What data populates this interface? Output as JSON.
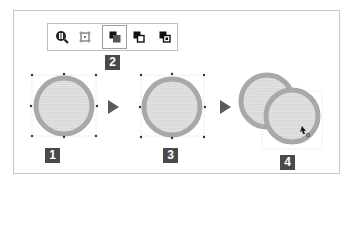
{
  "diagram": {
    "toolbar": {
      "buttons": [
        {
          "name": "zoom-object",
          "icon": "magnifier-icon",
          "active": false
        },
        {
          "name": "fit-object",
          "icon": "frame-center-icon",
          "active": false
        },
        {
          "name": "bring-to-front",
          "icon": "bring-front-icon",
          "active": true
        },
        {
          "name": "bring-forward",
          "icon": "bring-forward-icon",
          "active": false
        },
        {
          "name": "send-backward",
          "icon": "send-backward-icon",
          "active": false
        }
      ]
    },
    "steps": [
      {
        "label": "1",
        "caption": "selected circle"
      },
      {
        "label": "2",
        "caption": "toolbar button"
      },
      {
        "label": "3",
        "caption": "circle after command"
      },
      {
        "label": "4",
        "caption": "overlapping duplicate being dragged"
      }
    ],
    "colors": {
      "circle_stroke": "#a8a8a8",
      "circle_fill": "#dedede",
      "badge_bg": "#4a4a4a",
      "badge_text": "#ffffff",
      "arrow": "#5a5a5a",
      "frame_border": "#c8c8c8"
    }
  }
}
